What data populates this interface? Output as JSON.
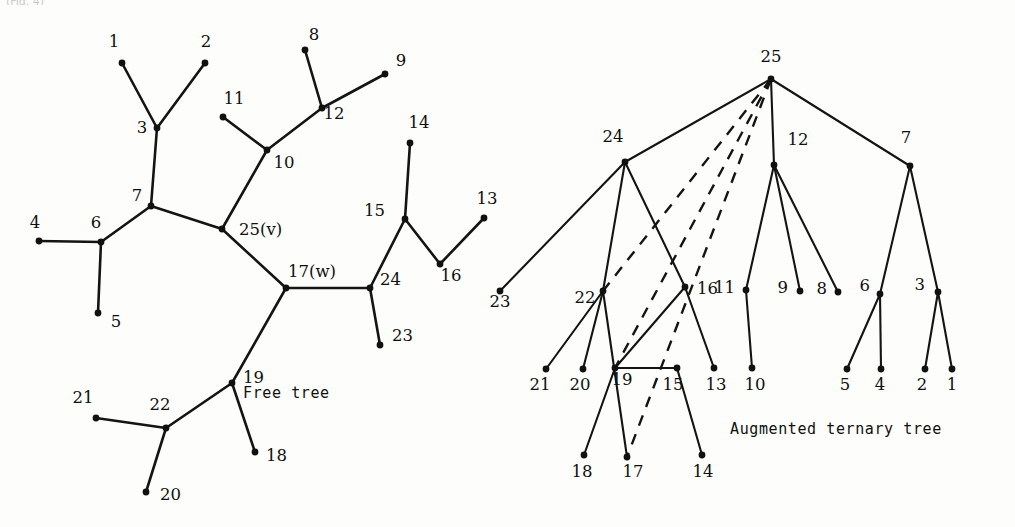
{
  "figure": {
    "top_partial_text": "(Fig. 4)",
    "panels": [
      {
        "id": "free-tree",
        "caption": "Free tree",
        "caption_pos": {
          "x": 243,
          "y": 398
        },
        "special_labels": {
          "v": "25(v)",
          "w": "17(w)"
        },
        "nodes": [
          {
            "id": "1",
            "label": "1",
            "x": 122,
            "y": 63,
            "lx": 114,
            "ly": 47,
            "anchor": "middle"
          },
          {
            "id": "2",
            "label": "2",
            "x": 205,
            "y": 63,
            "lx": 206,
            "ly": 47,
            "anchor": "middle"
          },
          {
            "id": "3",
            "label": "3",
            "x": 157,
            "y": 128,
            "lx": 142,
            "ly": 133,
            "anchor": "middle"
          },
          {
            "id": "7",
            "label": "7",
            "x": 151,
            "y": 206,
            "lx": 137,
            "ly": 201,
            "anchor": "middle"
          },
          {
            "id": "6",
            "label": "6",
            "x": 101,
            "y": 242,
            "lx": 96,
            "ly": 228,
            "anchor": "middle"
          },
          {
            "id": "4",
            "label": "4",
            "x": 39,
            "y": 241,
            "lx": 35,
            "ly": 228,
            "anchor": "middle"
          },
          {
            "id": "5",
            "label": "5",
            "x": 98,
            "y": 313,
            "lx": 116,
            "ly": 327,
            "anchor": "middle"
          },
          {
            "id": "11",
            "label": "11",
            "x": 223,
            "y": 117,
            "lx": 234,
            "ly": 104,
            "anchor": "middle"
          },
          {
            "id": "10",
            "label": "10",
            "x": 267,
            "y": 150,
            "lx": 284,
            "ly": 168,
            "anchor": "middle"
          },
          {
            "id": "12",
            "label": "12",
            "x": 322,
            "y": 108,
            "lx": 334,
            "ly": 119,
            "anchor": "middle"
          },
          {
            "id": "8",
            "label": "8",
            "x": 305,
            "y": 50,
            "lx": 314,
            "ly": 40,
            "anchor": "middle"
          },
          {
            "id": "9",
            "label": "9",
            "x": 385,
            "y": 74,
            "lx": 401,
            "ly": 66,
            "anchor": "middle"
          },
          {
            "id": "25",
            "label": "25(v)",
            "x": 222,
            "y": 229,
            "lx": 239,
            "ly": 235,
            "anchor": "start"
          },
          {
            "id": "17",
            "label": "17(w)",
            "x": 286,
            "y": 288,
            "lx": 288,
            "ly": 277,
            "anchor": "start"
          },
          {
            "id": "24",
            "label": "24",
            "x": 370,
            "y": 288,
            "lx": 380,
            "ly": 285,
            "anchor": "start"
          },
          {
            "id": "23",
            "label": "23",
            "x": 380,
            "y": 345,
            "lx": 392,
            "ly": 341,
            "anchor": "start"
          },
          {
            "id": "15",
            "label": "15",
            "x": 405,
            "y": 219,
            "lx": 385,
            "ly": 216,
            "anchor": "end"
          },
          {
            "id": "14",
            "label": "14",
            "x": 410,
            "y": 143,
            "lx": 419,
            "ly": 128,
            "anchor": "middle"
          },
          {
            "id": "16",
            "label": "16",
            "x": 440,
            "y": 264,
            "lx": 451,
            "ly": 281,
            "anchor": "middle"
          },
          {
            "id": "13",
            "label": "13",
            "x": 484,
            "y": 218,
            "lx": 487,
            "ly": 204,
            "anchor": "middle"
          },
          {
            "id": "19",
            "label": "19",
            "x": 232,
            "y": 383,
            "lx": 243,
            "ly": 383,
            "anchor": "start"
          },
          {
            "id": "18",
            "label": "18",
            "x": 255,
            "y": 452,
            "lx": 266,
            "ly": 461,
            "anchor": "start"
          },
          {
            "id": "22",
            "label": "22",
            "x": 166,
            "y": 428,
            "lx": 160,
            "ly": 410,
            "anchor": "middle"
          },
          {
            "id": "21",
            "label": "21",
            "x": 96,
            "y": 418,
            "lx": 83,
            "ly": 403,
            "anchor": "middle"
          },
          {
            "id": "20",
            "label": "20",
            "x": 146,
            "y": 492,
            "lx": 160,
            "ly": 500,
            "anchor": "start"
          }
        ],
        "edges": [
          [
            "1",
            "3"
          ],
          [
            "2",
            "3"
          ],
          [
            "3",
            "7"
          ],
          [
            "7",
            "6"
          ],
          [
            "6",
            "4"
          ],
          [
            "6",
            "5"
          ],
          [
            "7",
            "25"
          ],
          [
            "25",
            "10"
          ],
          [
            "10",
            "11"
          ],
          [
            "10",
            "12"
          ],
          [
            "12",
            "8"
          ],
          [
            "12",
            "9"
          ],
          [
            "25",
            "17"
          ],
          [
            "17",
            "24"
          ],
          [
            "24",
            "23"
          ],
          [
            "24",
            "15"
          ],
          [
            "15",
            "14"
          ],
          [
            "15",
            "16"
          ],
          [
            "16",
            "13"
          ],
          [
            "17",
            "19"
          ],
          [
            "19",
            "18"
          ],
          [
            "19",
            "22"
          ],
          [
            "22",
            "21"
          ],
          [
            "22",
            "20"
          ]
        ]
      },
      {
        "id": "augmented-ternary-tree",
        "caption": "Augmented ternary tree",
        "caption_pos": {
          "x": 730,
          "y": 434
        },
        "nodes": [
          {
            "id": "25",
            "label": "25",
            "x": 771,
            "y": 79,
            "lx": 771,
            "ly": 62,
            "anchor": "middle"
          },
          {
            "id": "24",
            "label": "24",
            "x": 625,
            "y": 162,
            "lx": 613,
            "ly": 142,
            "anchor": "middle"
          },
          {
            "id": "12",
            "label": "12",
            "x": 774,
            "y": 165,
            "lx": 798,
            "ly": 145,
            "anchor": "middle"
          },
          {
            "id": "7",
            "label": "7",
            "x": 910,
            "y": 166,
            "lx": 906,
            "ly": 143,
            "anchor": "middle"
          },
          {
            "id": "23",
            "label": "23",
            "x": 500,
            "y": 291,
            "lx": 500,
            "ly": 307,
            "anchor": "middle"
          },
          {
            "id": "22",
            "label": "22",
            "x": 603,
            "y": 291,
            "lx": 585,
            "ly": 303,
            "anchor": "middle"
          },
          {
            "id": "16",
            "label": "16",
            "x": 685,
            "y": 287,
            "lx": 697,
            "ly": 294,
            "anchor": "start"
          },
          {
            "id": "11",
            "label": "11",
            "x": 746,
            "y": 290,
            "lx": 735,
            "ly": 293,
            "anchor": "end"
          },
          {
            "id": "9",
            "label": "9",
            "x": 800,
            "y": 291,
            "lx": 788,
            "ly": 293,
            "anchor": "end"
          },
          {
            "id": "8",
            "label": "8",
            "x": 838,
            "y": 292,
            "lx": 827,
            "ly": 294,
            "anchor": "end"
          },
          {
            "id": "6",
            "label": "6",
            "x": 880,
            "y": 294,
            "lx": 870,
            "ly": 291,
            "anchor": "end"
          },
          {
            "id": "3",
            "label": "3",
            "x": 938,
            "y": 292,
            "lx": 925,
            "ly": 290,
            "anchor": "end"
          },
          {
            "id": "21",
            "label": "21",
            "x": 546,
            "y": 369,
            "lx": 540,
            "ly": 390,
            "anchor": "middle"
          },
          {
            "id": "20",
            "label": "20",
            "x": 583,
            "y": 369,
            "lx": 580,
            "ly": 390,
            "anchor": "middle"
          },
          {
            "id": "19",
            "label": "19",
            "x": 615,
            "y": 368,
            "lx": 622,
            "ly": 385,
            "anchor": "middle"
          },
          {
            "id": "15",
            "label": "15",
            "x": 677,
            "y": 368,
            "lx": 673,
            "ly": 390,
            "anchor": "middle"
          },
          {
            "id": "13",
            "label": "13",
            "x": 714,
            "y": 368,
            "lx": 716,
            "ly": 390,
            "anchor": "middle"
          },
          {
            "id": "10",
            "label": "10",
            "x": 752,
            "y": 368,
            "lx": 755,
            "ly": 390,
            "anchor": "middle"
          },
          {
            "id": "5",
            "label": "5",
            "x": 847,
            "y": 369,
            "lx": 845,
            "ly": 390,
            "anchor": "middle"
          },
          {
            "id": "4",
            "label": "4",
            "x": 881,
            "y": 369,
            "lx": 880,
            "ly": 390,
            "anchor": "middle"
          },
          {
            "id": "2",
            "label": "2",
            "x": 925,
            "y": 369,
            "lx": 922,
            "ly": 390,
            "anchor": "middle"
          },
          {
            "id": "1",
            "label": "1",
            "x": 952,
            "y": 369,
            "lx": 952,
            "ly": 390,
            "anchor": "middle"
          },
          {
            "id": "18",
            "label": "18",
            "x": 584,
            "y": 455,
            "lx": 582,
            "ly": 477,
            "anchor": "middle"
          },
          {
            "id": "17",
            "label": "17",
            "x": 627,
            "y": 457,
            "lx": 633,
            "ly": 477,
            "anchor": "middle"
          },
          {
            "id": "14",
            "label": "14",
            "x": 702,
            "y": 455,
            "lx": 703,
            "ly": 477,
            "anchor": "middle"
          }
        ],
        "solid_edges": [
          [
            "25",
            "24"
          ],
          [
            "25",
            "12"
          ],
          [
            "25",
            "7"
          ],
          [
            "24",
            "23"
          ],
          [
            "24",
            "22"
          ],
          [
            "24",
            "16"
          ],
          [
            "22",
            "21"
          ],
          [
            "22",
            "20"
          ],
          [
            "22",
            "17"
          ],
          [
            "19",
            "18"
          ],
          [
            "19",
            "15"
          ],
          [
            "16",
            "19"
          ],
          [
            "16",
            "13"
          ],
          [
            "12",
            "11"
          ],
          [
            "12",
            "9"
          ],
          [
            "12",
            "8"
          ],
          [
            "11",
            "10"
          ],
          [
            "7",
            "6"
          ],
          [
            "7",
            "3"
          ],
          [
            "6",
            "5"
          ],
          [
            "6",
            "4"
          ],
          [
            "3",
            "2"
          ],
          [
            "3",
            "1"
          ],
          [
            "15",
            "14"
          ]
        ],
        "dashed_edges": [
          [
            "25",
            "22"
          ],
          [
            "25",
            "19"
          ],
          [
            "25",
            "17"
          ]
        ]
      }
    ]
  }
}
